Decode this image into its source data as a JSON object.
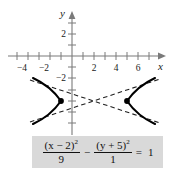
{
  "figure": {
    "name": "hyperbola-graph-with-equation",
    "graph": {
      "axes": {
        "x_axis_label": "x",
        "y_axis_label": "y",
        "x_tick_labels": [
          "-4",
          "-2",
          "2",
          "4",
          "6"
        ],
        "x_tick_values": [
          -4,
          -2,
          2,
          4,
          6
        ],
        "y_tick_labels": [
          "2",
          "-2"
        ],
        "y_tick_values": [
          2,
          -2
        ],
        "x_range": [
          -5.8,
          8.2
        ],
        "y_range": [
          -8.0,
          3.2
        ],
        "tick_step": 1,
        "arrow_ends": [
          "x-positive",
          "y-positive"
        ]
      },
      "curve": {
        "type": "hyperbola",
        "orientation": "horizontal",
        "center": [
          2,
          -5
        ],
        "a": 3,
        "b": 1,
        "vertices": [
          [
            -1,
            -5
          ],
          [
            5,
            -5
          ]
        ],
        "asymptote_slopes": [
          0.3333,
          -0.3333
        ],
        "curve_style": "solid",
        "asymptote_style": "dashed",
        "vertex_marker": "filled-dot"
      },
      "colors": {
        "curve": "#000000",
        "asymptote": "#2b2b2b",
        "axis": "#7a7a7a",
        "text": "#1a1a1a"
      }
    },
    "equation": {
      "numerator_1": "(x − 2)",
      "numerator_1_exponent": "2",
      "denominator_1": "9",
      "operator": "−",
      "numerator_2": "(y + 5)",
      "numerator_2_exponent": "2",
      "denominator_2": "1",
      "equals": "=",
      "right_hand_side": "1",
      "background_color": "#d9d9d9"
    }
  }
}
